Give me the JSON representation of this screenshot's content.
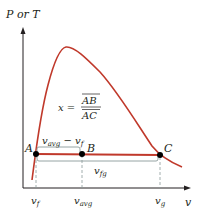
{
  "diagram": {
    "colors": {
      "curve": "#c0392b",
      "tie_line": "#c0392b",
      "axis": "#231f20",
      "bracket": "#8a9a9a",
      "dashed": "#8a9a9a",
      "point": "#000000"
    },
    "axes": {
      "y_label": "P or T",
      "x_label": "v"
    },
    "points": [
      {
        "id": "A",
        "label": "A"
      },
      {
        "id": "B",
        "label": "B"
      },
      {
        "id": "C",
        "label": "C"
      }
    ],
    "brackets": {
      "upper": {
        "main": "v",
        "sub": "avg",
        "minus": " − v",
        "sub2": "f"
      },
      "lower": {
        "main": "v",
        "sub": "fg"
      }
    },
    "equation": {
      "lhs": "x =",
      "numerator": "AB",
      "denominator": "AC"
    },
    "x_ticks": [
      {
        "main": "v",
        "sub": "f"
      },
      {
        "main": "v",
        "sub": "avg"
      },
      {
        "main": "v",
        "sub": "g"
      }
    ]
  }
}
